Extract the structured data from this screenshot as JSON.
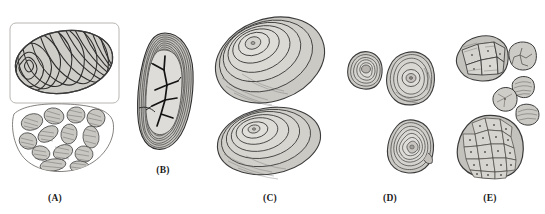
{
  "figure": {
    "type": "scientific-specimen-plate",
    "background_color": "#ffffff",
    "ink_color": "#2b2b2b",
    "fill_light": "#d8d6d2",
    "fill_mid": "#bfbcb7",
    "fill_dark": "#9d9a95",
    "panel_count": 5
  },
  "panels": [
    {
      "id": "A",
      "label": "(A)",
      "label_x": 55,
      "label_y": 193,
      "description": "Framed concentric banded ovoid above an outlined mass of rounded striated clasts",
      "specimens": [
        {
          "name": "framed-banded-ovoid",
          "framed": true,
          "frame_color": "#b8b6b2",
          "texture": "wavy-concentric-bands",
          "nucleus_position": "left",
          "band_count": 26
        },
        {
          "name": "clast-aggregate-outline",
          "framed": false,
          "texture": "rounded-striated-clasts",
          "clast_count": 13
        }
      ]
    },
    {
      "id": "B",
      "label": "(B)",
      "label_x": 163,
      "label_y": 165,
      "description": "Vertical ovoid with thick striated rim and dark branching crack network in core",
      "specimens": [
        {
          "name": "cracked-core-ovoid",
          "framed": false,
          "texture": "fine-rim-striations",
          "rim_line_count": 22,
          "crack_pattern": "dendritic-branching"
        }
      ]
    },
    {
      "id": "C",
      "label": "(C)",
      "label_x": 270,
      "label_y": 193,
      "description": "Two large nested concentric-ring ovoids with stepped terraced layers",
      "specimens": [
        {
          "name": "large-tilted-ring-ovoid",
          "framed": false,
          "texture": "nested-offset-rings",
          "ring_count": 7,
          "nucleus_position": "upper-left"
        },
        {
          "name": "flat-wide-ring-ovoid",
          "framed": false,
          "texture": "nested-offset-rings",
          "ring_count": 7,
          "nucleus_position": "upper-left"
        }
      ]
    },
    {
      "id": "D",
      "label": "(D)",
      "label_x": 390,
      "label_y": 193,
      "description": "Three small angular nodules with contour-following concentric layering",
      "specimens": [
        {
          "name": "small-square-nodule",
          "framed": false,
          "texture": "concentric-contours",
          "ring_count": 8
        },
        {
          "name": "round-nucleus-nodule",
          "framed": false,
          "texture": "concentric-contours",
          "ring_count": 7,
          "nucleus_position": "center"
        },
        {
          "name": "triangular-nodule",
          "framed": false,
          "texture": "concentric-contours",
          "ring_count": 9
        }
      ]
    },
    {
      "id": "E",
      "label": "(E)",
      "label_x": 490,
      "label_y": 193,
      "description": "Polygonal cellular aggregates and isolated fragments with dotted cell centres",
      "specimens": [
        {
          "name": "upper-cell-cluster",
          "framed": false,
          "texture": "polygonal-cells",
          "cell_count": 6
        },
        {
          "name": "star-pattern-fragment",
          "framed": false,
          "texture": "star-fracture",
          "cell_count": 1
        },
        {
          "name": "small-fragment-striated",
          "framed": false,
          "texture": "fine-striations",
          "cell_count": 1
        },
        {
          "name": "small-fragment-round",
          "framed": false,
          "texture": "polygonal-cells",
          "cell_count": 1
        },
        {
          "name": "small-fragment-oval",
          "framed": false,
          "texture": "fine-striations",
          "cell_count": 1
        },
        {
          "name": "large-cell-mass",
          "framed": false,
          "texture": "polygonal-cells",
          "cell_count": 20
        }
      ]
    }
  ]
}
